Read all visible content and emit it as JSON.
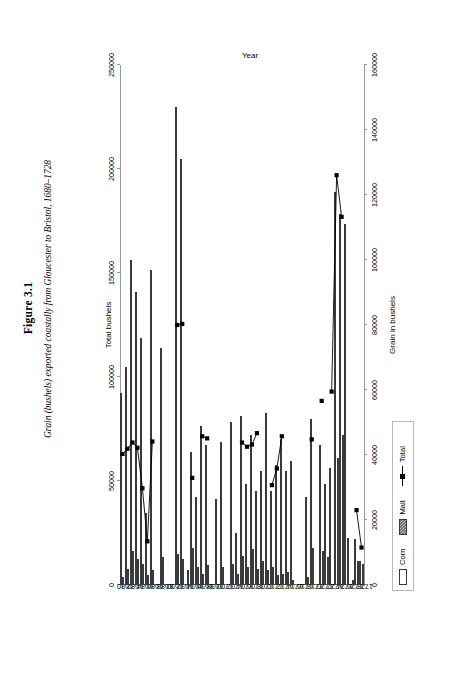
{
  "figure": {
    "number": "Figure 3.1",
    "caption": "Grain (bushels) exported coastally from Gloucester to Bristol, 1680–1728"
  },
  "legend": {
    "position": "bottom-right",
    "items": [
      {
        "name": "corn-swatch",
        "label": "Corn",
        "style": "hollow-bar",
        "color": "#ffffff"
      },
      {
        "name": "malt-swatch",
        "label": "Malt",
        "style": "hatched-bar",
        "color": "#b5b5b5"
      },
      {
        "name": "total-swatch",
        "label": "Total",
        "style": "line-marker",
        "color": "#000000"
      }
    ]
  },
  "chart_data": {
    "type": "bar",
    "orientation": "horizontal",
    "title": "Grain (bushels) exported coastally from Gloucester to Bristol, 1680–1728",
    "xlabel": "Year",
    "ylabel": "Grain in bushels",
    "y2label": "Total bushels",
    "ylim": [
      0,
      160000
    ],
    "y2lim": [
      0,
      250000
    ],
    "yticks": [
      0,
      20000,
      40000,
      60000,
      80000,
      100000,
      120000,
      140000,
      160000
    ],
    "ytick_labels": [
      "0",
      "20000",
      "40000",
      "60000",
      "80000",
      "100000",
      "120000",
      "140000",
      "160000"
    ],
    "y2ticks": [
      0,
      50000,
      100000,
      150000,
      200000,
      250000
    ],
    "y2tick_labels": [
      "0",
      "50000",
      "100000",
      "150000",
      "200000",
      "250000"
    ],
    "grid": false,
    "categories": [
      1680,
      1681,
      1682,
      1683,
      1684,
      1685,
      1686,
      1687,
      1688,
      1689,
      1690,
      1691,
      1692,
      1693,
      1694,
      1695,
      1696,
      1697,
      1698,
      1699,
      1700,
      1701,
      1702,
      1703,
      1704,
      1705,
      1706,
      1707,
      1708,
      1709,
      1710,
      1711,
      1712,
      1713,
      1714,
      1715,
      1716,
      1717,
      1718,
      1719,
      1720,
      1721,
      1722,
      1723,
      1724,
      1725,
      1726,
      1727,
      1728
    ],
    "category_tick_labels": [
      "1680",
      "1682",
      "1684",
      "1686",
      "1688",
      "1690",
      "1692",
      "1694",
      "1696",
      "1698",
      "1700",
      "1702",
      "1704",
      "1706",
      "1708",
      "1710",
      "1712",
      "1714",
      "1716",
      "1718",
      "1720",
      "1722",
      "1724",
      "1726",
      "1728"
    ],
    "series": [
      {
        "name": "Corn",
        "axis": "primary",
        "values": [
          2500,
          5000,
          10500,
          8000,
          6500,
          3000,
          4500,
          0,
          8500,
          0,
          0,
          9500,
          8000,
          4500,
          11500,
          5500,
          3500,
          6000,
          0,
          0,
          5500,
          0,
          6500,
          3500,
          9000,
          5500,
          11000,
          5000,
          7500,
          4500,
          5500,
          3000,
          3500,
          4000,
          1500,
          0,
          0,
          2500,
          11500,
          0,
          10500,
          8500,
          0,
          39000,
          46000,
          14500,
          1500,
          7500,
          6500
        ]
      },
      {
        "name": "Malt",
        "axis": "primary",
        "values": [
          59000,
          67000,
          100000,
          90000,
          76000,
          22000,
          97000,
          0,
          73000,
          0,
          0,
          147000,
          131000,
          0,
          41000,
          27000,
          49000,
          43000,
          0,
          26500,
          44000,
          0,
          50000,
          16000,
          52000,
          31000,
          46000,
          29000,
          35000,
          53000,
          29000,
          37000,
          45000,
          35000,
          38000,
          0,
          0,
          27000,
          51000,
          0,
          43000,
          31000,
          36000,
          121000,
          114000,
          111000,
          0,
          14000,
          7500
        ]
      },
      {
        "name": "Total",
        "axis": "secondary",
        "values": [
          63000,
          65500,
          68500,
          66000,
          46500,
          21000,
          69000,
          null,
          null,
          null,
          null,
          125000,
          125500,
          null,
          51500,
          null,
          71500,
          70500,
          null,
          null,
          null,
          null,
          null,
          null,
          68500,
          66500,
          67500,
          73000,
          null,
          null,
          48000,
          56000,
          71500,
          null,
          null,
          null,
          null,
          null,
          70000,
          null,
          88500,
          null,
          93000,
          197000,
          177000,
          null,
          null,
          36000,
          18000
        ]
      }
    ]
  }
}
